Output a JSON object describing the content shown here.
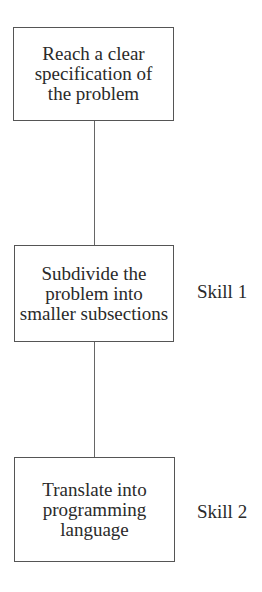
{
  "diagram": {
    "type": "flowchart",
    "nodes": [
      {
        "id": "step1",
        "label": "Reach a clear specification of the problem",
        "lines": [
          "Reach a clear",
          "specification of",
          "the problem"
        ],
        "skill": ""
      },
      {
        "id": "step2",
        "label": "Subdivide the problem into smaller subsections",
        "lines": [
          "Subdivide the",
          "problem into",
          "smaller subsections"
        ],
        "skill": "Skill 1"
      },
      {
        "id": "step3",
        "label": "Translate into programming language",
        "lines": [
          "Translate into",
          "programming",
          "language"
        ],
        "skill": "Skill 2"
      }
    ],
    "edges": [
      {
        "from": "step1",
        "to": "step2"
      },
      {
        "from": "step2",
        "to": "step3"
      }
    ]
  }
}
